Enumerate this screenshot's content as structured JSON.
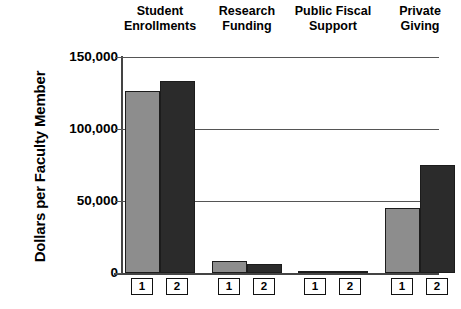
{
  "chart_data": {
    "type": "bar",
    "title": "",
    "xlabel": "",
    "ylabel": "Dollars per Faculty Member",
    "ylim": [
      0,
      150000
    ],
    "yticks": [
      0,
      50000,
      100000,
      150000
    ],
    "ytick_labels": [
      "0",
      "50,000",
      "100,000",
      "150,000"
    ],
    "grid": true,
    "legend_position": "below-axis-boxes",
    "categories": [
      "Student Enrollments",
      "Research Funding",
      "Public Fiscal Support",
      "Private Giving"
    ],
    "category_lines": [
      [
        "Student",
        "Enrollments"
      ],
      [
        "Research",
        "Funding"
      ],
      [
        "Public Fiscal",
        "Support"
      ],
      [
        "Private",
        "Giving"
      ]
    ],
    "series": [
      {
        "name": "1",
        "color": "#8d8d8d",
        "values": [
          126500,
          8300,
          400,
          45100
        ]
      },
      {
        "name": "2",
        "color": "#2b2b2b",
        "values": [
          133300,
          6250,
          400,
          75000
        ]
      }
    ],
    "series_box_labels": [
      "1",
      "2"
    ]
  },
  "colors": {
    "series1": "#8d8d8d",
    "series2": "#2b2b2b",
    "axis": "#444444",
    "grid": "#555555",
    "background": "#ffffff"
  }
}
